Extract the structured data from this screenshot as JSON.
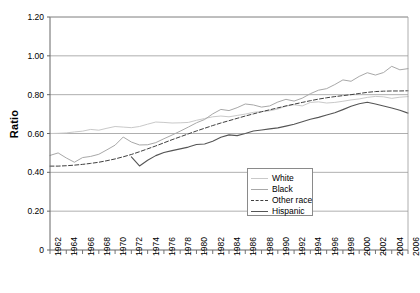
{
  "chart_data": {
    "type": "line",
    "title": "",
    "xlabel": "",
    "ylabel": "Ratio",
    "ylim": [
      0,
      1.2
    ],
    "xlim": [
      1962,
      2006
    ],
    "grid": true,
    "legend_position": "inside-bottom-center",
    "ytick_labels": [
      "0",
      "0.20",
      "0.40",
      "0.60",
      "0.80",
      "1.00",
      "1.20"
    ],
    "ytick_values": [
      0,
      0.2,
      0.4,
      0.6,
      0.8,
      1.0,
      1.2
    ],
    "xtick_labels": [
      "1962",
      "1964",
      "1966",
      "1968",
      "1970",
      "1972",
      "1974",
      "1976",
      "1978",
      "1980",
      "1982",
      "1984",
      "1986",
      "1988",
      "1990",
      "1992",
      "1994",
      "1996",
      "1998",
      "2000",
      "2002",
      "2004",
      "2006"
    ],
    "x": [
      1962,
      1963,
      1964,
      1965,
      1966,
      1967,
      1968,
      1969,
      1970,
      1971,
      1972,
      1973,
      1974,
      1975,
      1976,
      1977,
      1978,
      1979,
      1980,
      1981,
      1982,
      1983,
      1984,
      1985,
      1986,
      1987,
      1988,
      1989,
      1990,
      1991,
      1992,
      1993,
      1994,
      1995,
      1996,
      1997,
      1998,
      1999,
      2000,
      2001,
      2002,
      2003,
      2004,
      2005,
      2006
    ],
    "series": [
      {
        "name": "White",
        "color": "#c9c9c9",
        "style": "solid",
        "values": [
          0.6,
          0.601,
          0.603,
          0.608,
          0.612,
          0.621,
          0.617,
          0.627,
          0.636,
          0.633,
          0.63,
          0.636,
          0.648,
          0.659,
          0.657,
          0.654,
          0.655,
          0.657,
          0.668,
          0.677,
          0.686,
          0.69,
          0.686,
          0.693,
          0.7,
          0.709,
          0.713,
          0.717,
          0.726,
          0.741,
          0.748,
          0.742,
          0.76,
          0.763,
          0.757,
          0.76,
          0.766,
          0.773,
          0.778,
          0.786,
          0.791,
          0.789,
          0.781,
          0.787,
          0.79
        ]
      },
      {
        "name": "Black",
        "color": "#a8a8a8",
        "style": "solid",
        "values": [
          0.487,
          0.5,
          0.474,
          0.452,
          0.476,
          0.482,
          0.493,
          0.516,
          0.54,
          0.582,
          0.556,
          0.541,
          0.542,
          0.553,
          0.573,
          0.592,
          0.612,
          0.633,
          0.655,
          0.672,
          0.701,
          0.724,
          0.718,
          0.733,
          0.752,
          0.747,
          0.736,
          0.742,
          0.762,
          0.776,
          0.767,
          0.782,
          0.805,
          0.823,
          0.831,
          0.852,
          0.876,
          0.869,
          0.894,
          0.913,
          0.901,
          0.914,
          0.946,
          0.928,
          0.934
        ]
      },
      {
        "name": "Other race",
        "color": "#3f3f3f",
        "style": "dashed",
        "values": [
          0.432,
          0.432,
          0.434,
          0.437,
          0.441,
          0.446,
          0.452,
          0.46,
          0.469,
          0.48,
          0.492,
          0.506,
          0.521,
          0.536,
          0.552,
          0.568,
          0.583,
          0.598,
          0.613,
          0.627,
          0.641,
          0.654,
          0.666,
          0.678,
          0.69,
          0.701,
          0.712,
          0.722,
          0.732,
          0.742,
          0.751,
          0.76,
          0.769,
          0.777,
          0.784,
          0.79,
          0.795,
          0.8,
          0.806,
          0.812,
          0.816,
          0.818,
          0.819,
          0.819,
          0.82
        ]
      },
      {
        "name": "Hispanic",
        "color": "#555555",
        "style": "solid",
        "values": [
          null,
          null,
          null,
          null,
          null,
          null,
          null,
          null,
          null,
          null,
          0.48,
          0.433,
          0.462,
          0.486,
          0.502,
          0.512,
          0.521,
          0.53,
          0.543,
          0.546,
          0.56,
          0.581,
          0.593,
          0.589,
          0.6,
          0.613,
          0.618,
          0.624,
          0.629,
          0.638,
          0.648,
          0.661,
          0.673,
          0.683,
          0.695,
          0.707,
          0.723,
          0.74,
          0.753,
          0.761,
          0.752,
          0.742,
          0.731,
          0.72,
          0.705
        ]
      }
    ]
  },
  "legend": {
    "items": [
      {
        "label": "White"
      },
      {
        "label": "Black"
      },
      {
        "label": "Other race"
      },
      {
        "label": "Hispanic"
      }
    ]
  }
}
